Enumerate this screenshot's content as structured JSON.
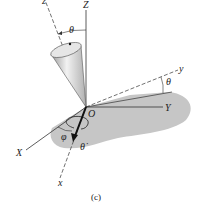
{
  "diagram": {
    "caption": "(c)",
    "labels": {
      "Z_axis": "Z",
      "z_axis": "z",
      "Y_axis": "Y",
      "y_axis": "y",
      "X_axis": "X",
      "x_axis": "x",
      "origin": "O",
      "theta_top": "θ",
      "theta_right": "θ",
      "phi": "φ",
      "theta_dot": "θ̇"
    },
    "colors": {
      "shadow": "#c4c4c4",
      "line": "#333333",
      "cone_light": "#f0f0f0",
      "cone_dark": "#9a9a9a"
    }
  }
}
